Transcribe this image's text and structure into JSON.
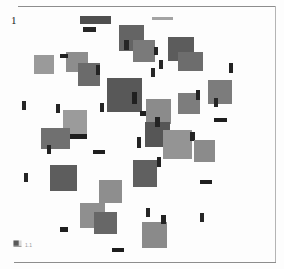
{
  "document": {
    "page_number": "1",
    "background_color": "#fdfdfd",
    "rule_color": "#8d8d8d"
  },
  "footer": {
    "icon": "flag-icon",
    "caption": "1.1"
  },
  "chart_data": {
    "type": "scatter",
    "title": "",
    "subtitle": "",
    "xlabel": "",
    "ylabel": "",
    "grid": false,
    "legend": "none",
    "xlim": [
      0,
      284
    ],
    "ylim": [
      0,
      269
    ],
    "palette": {
      "dark": "#4a4a4a",
      "mid_dark": "#5f5f5f",
      "mid": "#737373",
      "mid_light": "#8a8a8a",
      "light": "#9e9e9e",
      "pale": "#b0b0b0",
      "ink": "#2b2b2b"
    },
    "blocks": [
      {
        "x": 80,
        "y": 16,
        "w": 31,
        "h": 8,
        "fill": "#4f4f4f"
      },
      {
        "x": 83,
        "y": 27,
        "w": 13,
        "h": 5,
        "fill": "#262626"
      },
      {
        "x": 152,
        "y": 17,
        "w": 21,
        "h": 3,
        "fill": "#a3a3a3"
      },
      {
        "x": 119,
        "y": 25,
        "w": 25,
        "h": 26,
        "fill": "#646464"
      },
      {
        "x": 133,
        "y": 40,
        "w": 22,
        "h": 22,
        "fill": "#7a7a7a"
      },
      {
        "x": 124,
        "y": 40,
        "w": 5,
        "h": 10,
        "fill": "#252525"
      },
      {
        "x": 154,
        "y": 47,
        "w": 4,
        "h": 8,
        "fill": "#242424"
      },
      {
        "x": 168,
        "y": 37,
        "w": 26,
        "h": 24,
        "fill": "#5c5c5c"
      },
      {
        "x": 178,
        "y": 52,
        "w": 25,
        "h": 19,
        "fill": "#6d6d6d"
      },
      {
        "x": 66,
        "y": 52,
        "w": 22,
        "h": 20,
        "fill": "#8d8d8d"
      },
      {
        "x": 60,
        "y": 54,
        "w": 8,
        "h": 4,
        "fill": "#222222"
      },
      {
        "x": 34,
        "y": 55,
        "w": 20,
        "h": 19,
        "fill": "#9a9a9a"
      },
      {
        "x": 78,
        "y": 63,
        "w": 22,
        "h": 23,
        "fill": "#6b6b6b"
      },
      {
        "x": 96,
        "y": 65,
        "w": 4,
        "h": 10,
        "fill": "#242424"
      },
      {
        "x": 151,
        "y": 68,
        "w": 4,
        "h": 9,
        "fill": "#262626"
      },
      {
        "x": 107,
        "y": 78,
        "w": 35,
        "h": 34,
        "fill": "#585858"
      },
      {
        "x": 132,
        "y": 92,
        "w": 5,
        "h": 12,
        "fill": "#202020"
      },
      {
        "x": 100,
        "y": 103,
        "w": 4,
        "h": 9,
        "fill": "#242424"
      },
      {
        "x": 140,
        "y": 111,
        "w": 16,
        "h": 5,
        "fill": "#1f1f1f"
      },
      {
        "x": 146,
        "y": 99,
        "w": 25,
        "h": 25,
        "fill": "#8b8b8b"
      },
      {
        "x": 178,
        "y": 93,
        "w": 22,
        "h": 21,
        "fill": "#7d7d7d"
      },
      {
        "x": 196,
        "y": 90,
        "w": 4,
        "h": 10,
        "fill": "#232323"
      },
      {
        "x": 208,
        "y": 80,
        "w": 24,
        "h": 24,
        "fill": "#7c7c7c"
      },
      {
        "x": 214,
        "y": 118,
        "w": 13,
        "h": 4,
        "fill": "#1e1e1e"
      },
      {
        "x": 63,
        "y": 110,
        "w": 24,
        "h": 24,
        "fill": "#9b9b9b"
      },
      {
        "x": 56,
        "y": 104,
        "w": 4,
        "h": 9,
        "fill": "#242424"
      },
      {
        "x": 22,
        "y": 101,
        "w": 4,
        "h": 9,
        "fill": "#262626"
      },
      {
        "x": 41,
        "y": 128,
        "w": 29,
        "h": 21,
        "fill": "#707070"
      },
      {
        "x": 47,
        "y": 145,
        "w": 4,
        "h": 9,
        "fill": "#222222"
      },
      {
        "x": 70,
        "y": 134,
        "w": 17,
        "h": 5,
        "fill": "#1f1f1f"
      },
      {
        "x": 145,
        "y": 122,
        "w": 25,
        "h": 25,
        "fill": "#565656"
      },
      {
        "x": 155,
        "y": 117,
        "w": 5,
        "h": 10,
        "fill": "#232323"
      },
      {
        "x": 163,
        "y": 130,
        "w": 29,
        "h": 29,
        "fill": "#949494"
      },
      {
        "x": 137,
        "y": 137,
        "w": 4,
        "h": 11,
        "fill": "#232323"
      },
      {
        "x": 190,
        "y": 132,
        "w": 5,
        "h": 9,
        "fill": "#242424"
      },
      {
        "x": 194,
        "y": 140,
        "w": 21,
        "h": 22,
        "fill": "#8b8b8b"
      },
      {
        "x": 93,
        "y": 150,
        "w": 12,
        "h": 4,
        "fill": "#1e1e1e"
      },
      {
        "x": 50,
        "y": 165,
        "w": 27,
        "h": 26,
        "fill": "#5d5d5d"
      },
      {
        "x": 24,
        "y": 173,
        "w": 4,
        "h": 9,
        "fill": "#252525"
      },
      {
        "x": 133,
        "y": 160,
        "w": 24,
        "h": 27,
        "fill": "#606060"
      },
      {
        "x": 157,
        "y": 157,
        "w": 4,
        "h": 10,
        "fill": "#232323"
      },
      {
        "x": 99,
        "y": 180,
        "w": 23,
        "h": 23,
        "fill": "#8e8e8e"
      },
      {
        "x": 200,
        "y": 180,
        "w": 12,
        "h": 4,
        "fill": "#1f1f1f"
      },
      {
        "x": 80,
        "y": 203,
        "w": 25,
        "h": 25,
        "fill": "#8f8f8f"
      },
      {
        "x": 94,
        "y": 212,
        "w": 23,
        "h": 22,
        "fill": "#676767"
      },
      {
        "x": 60,
        "y": 227,
        "w": 8,
        "h": 5,
        "fill": "#1f1f1f"
      },
      {
        "x": 146,
        "y": 208,
        "w": 4,
        "h": 9,
        "fill": "#252525"
      },
      {
        "x": 200,
        "y": 213,
        "w": 4,
        "h": 9,
        "fill": "#272727"
      },
      {
        "x": 142,
        "y": 222,
        "w": 25,
        "h": 26,
        "fill": "#8a8a8a"
      },
      {
        "x": 161,
        "y": 215,
        "w": 5,
        "h": 9,
        "fill": "#222222"
      },
      {
        "x": 112,
        "y": 248,
        "w": 12,
        "h": 4,
        "fill": "#1d1d1d"
      },
      {
        "x": 214,
        "y": 98,
        "w": 4,
        "h": 9,
        "fill": "#262626"
      },
      {
        "x": 229,
        "y": 63,
        "w": 4,
        "h": 10,
        "fill": "#232323"
      },
      {
        "x": 159,
        "y": 60,
        "w": 4,
        "h": 9,
        "fill": "#262626"
      }
    ]
  }
}
